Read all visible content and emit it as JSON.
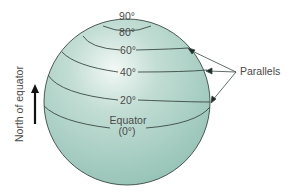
{
  "diagram": {
    "colors": {
      "globe_fill": "#a8cfc4",
      "globe_highlight": "#eef6f2",
      "globe_shadow": "#8fbcb0",
      "line": "#3a4a44",
      "text": "#4a4a4a"
    },
    "parallels": [
      {
        "label": "90°",
        "latitude": 90
      },
      {
        "label": "80°",
        "latitude": 80
      },
      {
        "label": "60°",
        "latitude": 60
      },
      {
        "label": "40°",
        "latitude": 40
      },
      {
        "label": "20°",
        "latitude": 20
      }
    ],
    "equator": {
      "label": "Equator",
      "sublabel": "(0°)"
    },
    "callout": {
      "label": "Parallels",
      "arrow_count": 3
    },
    "side_label": {
      "text": "North of equator",
      "arrow_direction": "up"
    }
  }
}
